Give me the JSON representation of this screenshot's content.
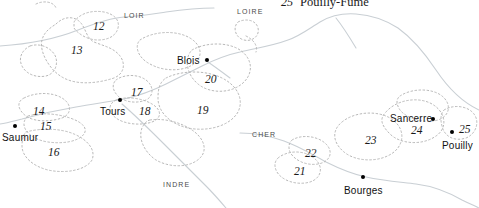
{
  "map": {
    "title_fragment": {
      "number": "25",
      "name": "Pouilly-Fumé"
    },
    "background_color": "#ffffff",
    "boundary_color": "#b8b8b8",
    "river_color": "#c9cfd4",
    "text_color": "#1a1a1a",
    "cities": [
      {
        "name": "Saumur",
        "label_x": 2,
        "label_y": 132,
        "dot_x": 13,
        "dot_y": 124
      },
      {
        "name": "Tours",
        "label_x": 100,
        "label_y": 106,
        "dot_x": 118,
        "dot_y": 98
      },
      {
        "name": "Blois",
        "label_x": 177,
        "label_y": 55,
        "dot_x": 205,
        "dot_y": 58
      },
      {
        "name": "Bourges",
        "label_x": 344,
        "label_y": 185,
        "dot_x": 361,
        "dot_y": 175
      },
      {
        "name": "Sancerre",
        "label_x": 390,
        "label_y": 113,
        "dot_x": 431,
        "dot_y": 117
      },
      {
        "name": "Pouilly",
        "label_x": 442,
        "label_y": 140,
        "dot_x": 450,
        "dot_y": 130
      }
    ],
    "zone_numbers": [
      {
        "value": "12",
        "x": 93,
        "y": 20
      },
      {
        "value": "13",
        "x": 71,
        "y": 44
      },
      {
        "value": "14",
        "x": 33,
        "y": 105
      },
      {
        "value": "15",
        "x": 40,
        "y": 120
      },
      {
        "value": "16",
        "x": 48,
        "y": 146
      },
      {
        "value": "17",
        "x": 131,
        "y": 86
      },
      {
        "value": "18",
        "x": 139,
        "y": 105
      },
      {
        "value": "19",
        "x": 197,
        "y": 104
      },
      {
        "value": "20",
        "x": 205,
        "y": 73
      },
      {
        "value": "21",
        "x": 294,
        "y": 165
      },
      {
        "value": "22",
        "x": 305,
        "y": 147
      },
      {
        "value": "23",
        "x": 365,
        "y": 134
      },
      {
        "value": "24",
        "x": 411,
        "y": 124
      },
      {
        "value": "25",
        "x": 459,
        "y": 123
      }
    ],
    "rivers": [
      {
        "name": "LOIR",
        "x": 124,
        "y": 12
      },
      {
        "name": "LOIRE",
        "x": 237,
        "y": 8
      },
      {
        "name": "CHER",
        "x": 252,
        "y": 131
      },
      {
        "name": "INDRE",
        "x": 163,
        "y": 181
      }
    ]
  }
}
